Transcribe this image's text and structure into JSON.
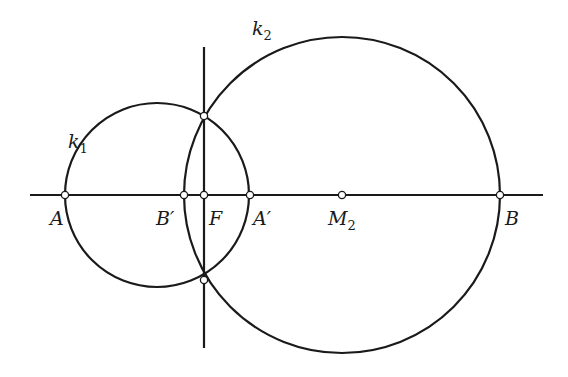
{
  "diagram": {
    "stroke_color": "#1a1a1a",
    "point_fill": "#ffffff",
    "stroke_width": 2.2,
    "baseline": {
      "x1": 30,
      "x2": 543,
      "y": 195
    },
    "perpendicular": {
      "x": 204,
      "y1": 47,
      "y2": 348
    },
    "circles": [
      {
        "name": "k1",
        "cx": 157,
        "cy": 195,
        "r": 92
      },
      {
        "name": "k2",
        "cx": 342,
        "cy": 195,
        "r": 158
      }
    ],
    "points": [
      {
        "name": "A",
        "x": 65,
        "y": 195
      },
      {
        "name": "B'",
        "x": 184,
        "y": 195
      },
      {
        "name": "F",
        "x": 204,
        "y": 195
      },
      {
        "name": "A'",
        "x": 250,
        "y": 195
      },
      {
        "name": "M2",
        "x": 342,
        "y": 195
      },
      {
        "name": "B",
        "x": 500,
        "y": 195
      },
      {
        "name": "upper-intersection",
        "x": 204,
        "y": 116
      },
      {
        "name": "lower-intersection",
        "x": 204,
        "y": 280
      }
    ]
  },
  "labels": {
    "k1": {
      "main": "k",
      "sub": "1"
    },
    "k2": {
      "main": "k",
      "sub": "2"
    },
    "A": "A",
    "B_prime": "B′",
    "F": "F",
    "A_prime": "A′",
    "M2": {
      "main": "M",
      "sub": "2"
    },
    "B": "B"
  }
}
